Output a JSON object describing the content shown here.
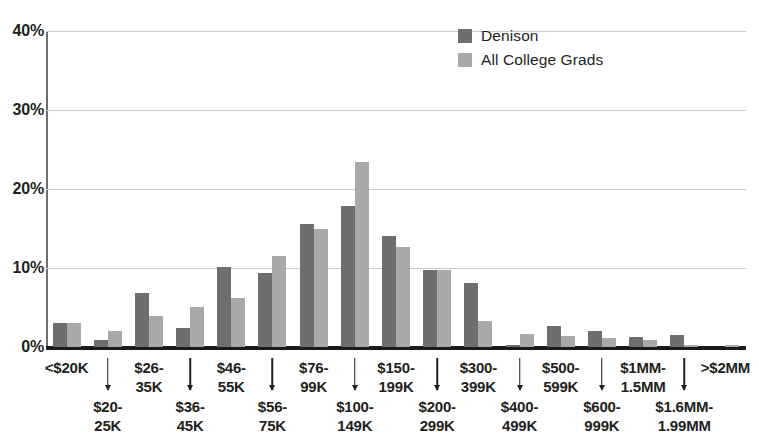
{
  "legend": {
    "position": "top-right",
    "entries": [
      {
        "label": "Denison",
        "color": "#6e6e6e"
      },
      {
        "label": "All College Grads",
        "color": "#a9a9a9"
      }
    ]
  },
  "axis": {
    "y_ticks": [
      "40%",
      "30%",
      "20%",
      "10%",
      "0%"
    ]
  },
  "chart_data": {
    "type": "bar",
    "title": "",
    "subtitle": "",
    "xlabel": "",
    "ylabel": "",
    "ylim": [
      0,
      40
    ],
    "ytick_values": [
      0,
      10,
      20,
      30,
      40
    ],
    "ytick_labels": [
      "0%",
      "10%",
      "20%",
      "30%",
      "40%"
    ],
    "grid": true,
    "legend_position": "top-right",
    "categories": [
      "<$20K",
      "$20-25K",
      "$26-35K",
      "$36-45K",
      "$46-55K",
      "$56-75K",
      "$76-99K",
      "$100-149K",
      "$150-199K",
      "$200-299K",
      "$300-399K",
      "$400-499K",
      "$500-599K",
      "$600-999K",
      "$1MM-1.5MM",
      "$1.6MM-1.99MM",
      ">$2MM"
    ],
    "series": [
      {
        "name": "Denison",
        "color": "#6e6e6e",
        "values": [
          3.0,
          0.9,
          6.9,
          2.4,
          10.1,
          9.4,
          15.6,
          17.8,
          14.0,
          9.7,
          8.1,
          0.2,
          2.7,
          2.0,
          1.3,
          1.5,
          0.0
        ]
      },
      {
        "name": "All College Grads",
        "color": "#a9a9a9",
        "values": [
          3.1,
          2.0,
          3.9,
          5.1,
          6.2,
          11.5,
          15.0,
          23.4,
          12.7,
          9.8,
          3.3,
          1.6,
          1.4,
          1.2,
          0.9,
          0.3,
          0.2
        ]
      }
    ]
  },
  "xaxis_labels": {
    "upper": [
      {
        "line1": "<$20K",
        "line2": ""
      },
      {
        "line1": "$26-",
        "line2": "35K"
      },
      {
        "line1": "$46-",
        "line2": "55K"
      },
      {
        "line1": "$76-",
        "line2": "99K"
      },
      {
        "line1": "$150-",
        "line2": "199K"
      },
      {
        "line1": "$300-",
        "line2": "399K"
      },
      {
        "line1": "$500-",
        "line2": "599K"
      },
      {
        "line1": "$1MM-",
        "line2": "1.5MM"
      },
      {
        "line1": ">$2MM",
        "line2": ""
      }
    ],
    "lower": [
      {
        "line1": "$20-",
        "line2": "25K"
      },
      {
        "line1": "$36-",
        "line2": "45K"
      },
      {
        "line1": "$56-",
        "line2": "75K"
      },
      {
        "line1": "$100-",
        "line2": "149K"
      },
      {
        "line1": "$200-",
        "line2": "299K"
      },
      {
        "line1": "$400-",
        "line2": "499K"
      },
      {
        "line1": "$600-",
        "line2": "999K"
      },
      {
        "line1": "$1.6MM-",
        "line2": "1.99MM"
      }
    ]
  },
  "colors": {
    "denison": "#6e6e6e",
    "all_college_grads": "#a9a9a9",
    "gridline": "#c9c9c9",
    "baseline": "#1b1b1b",
    "text": "#231f20"
  }
}
